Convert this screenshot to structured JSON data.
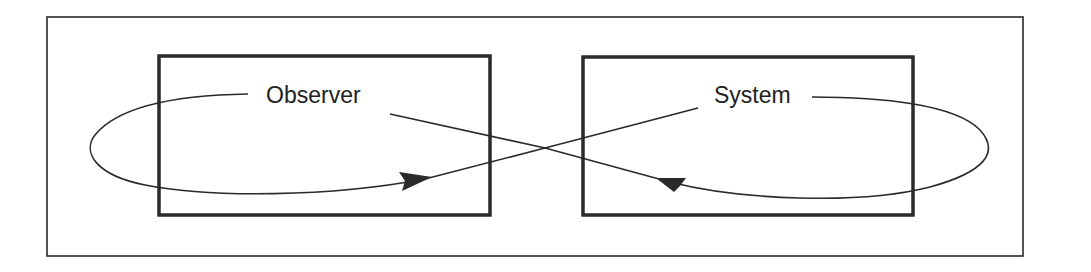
{
  "diagram": {
    "type": "observer-system feedback loop",
    "colors": {
      "background": "#ffffff",
      "stroke": "#2a2a2a"
    },
    "nodes": [
      {
        "id": "observer",
        "label": "Observer"
      },
      {
        "id": "system",
        "label": "System"
      }
    ],
    "edges": [
      {
        "from": "system",
        "to": "observer",
        "arrow": "arrowhead-right",
        "description": "line from System crosses over and loops around Observer, arrow pointing right into Observer box"
      },
      {
        "from": "observer",
        "to": "system",
        "arrow": "arrowhead-left",
        "description": "line from Observer crosses over and loops around System, arrow pointing left into System box"
      }
    ]
  }
}
